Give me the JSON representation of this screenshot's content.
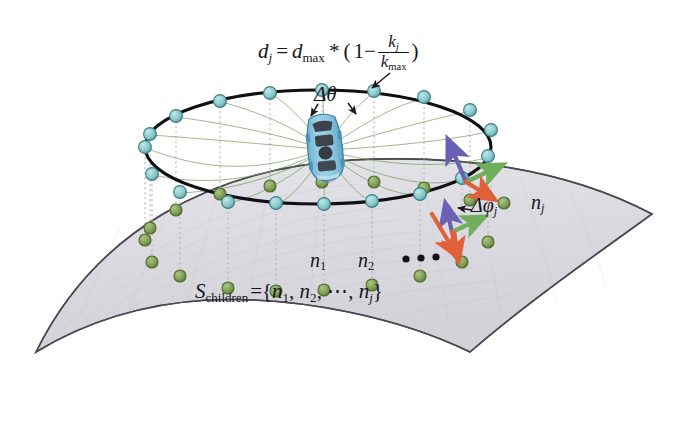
{
  "figure": {
    "kind": "3d-schematic-diagram",
    "background_color": "#ffffff"
  },
  "labels": {
    "distance_formula": {
      "lhs_var": "d",
      "lhs_sub": "j",
      "eq": "=",
      "rhs_var": "d",
      "rhs_sub": "max",
      "times": "*",
      "open_paren": "(",
      "one_minus": "1−",
      "frac_num_var": "k",
      "frac_num_sub": "j",
      "frac_den_var": "k",
      "frac_den_sub": "max",
      "close_paren": ")",
      "plain": "d_j = d_max * ( 1 − k_j / k_max )"
    },
    "delta_theta": "Δθ",
    "delta_phi": {
      "symbol": "Δφ",
      "sub": "j",
      "plain": "Δφ_j"
    },
    "node_j": {
      "symbol": "n",
      "sub": "j",
      "plain": "n_j"
    },
    "node_1": {
      "symbol": "n",
      "sub": "1",
      "plain": "n_1"
    },
    "node_2": {
      "symbol": "n",
      "sub": "2",
      "plain": "n_2"
    },
    "ellipsis_dots": "• • •",
    "children_set": {
      "lhs_var": "S",
      "lhs_sub": "children",
      "eq_open": "={",
      "item1_var": "n",
      "item1_sub": "1",
      "sep1": ", ",
      "item2_var": "n",
      "item2_sub": "2",
      "sep2": ", ⋯, ",
      "itemj_var": "n",
      "itemj_sub": "j",
      "close": "}",
      "plain": "S_children = { n_1, n_2, ⋯, n_j }"
    }
  },
  "colors": {
    "surface_fill": "#d9d8de",
    "surface_fill_light": "#e4e3e8",
    "surface_outline": "#4a4a50",
    "ring_stroke": "#101014",
    "ring_node_fill": "#87c8cb",
    "ring_node_stroke": "#3c7f84",
    "ground_node_fill": "#7f9e53",
    "ground_node_stroke": "#4e6b2c",
    "drop_line": "#b6b6bc",
    "radial_line": "#6f9a55",
    "car_body": "#8ec6e2",
    "car_body_dark": "#5da3c6",
    "car_window": "#3a3a40",
    "arrow_purple": "#6a61b4",
    "arrow_green": "#6fae5a",
    "arrow_orange": "#e0603a",
    "leader_arrow": "#1a1a1e",
    "text": "#16161a"
  },
  "geometry": {
    "ring_center": {
      "x": 318,
      "y": 147
    },
    "ring_radius_x": 173,
    "ring_radius_y": 57,
    "car_position": {
      "x": 325,
      "y": 148
    },
    "ring_node_count": 17,
    "surface_type": "hyperbolic-saddle-sheet"
  }
}
